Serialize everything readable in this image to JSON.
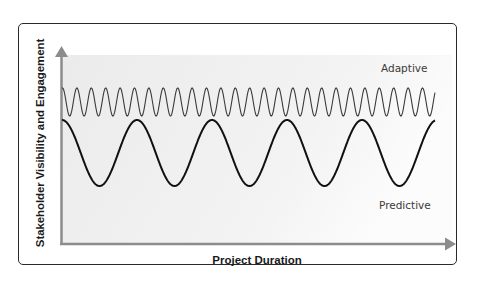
{
  "chart_data": {
    "type": "line",
    "title": "",
    "xlabel": "Project Duration",
    "ylabel": "Stakeholder Visibility and Engagement",
    "grid": false,
    "legend": "inline labels",
    "axes": {
      "x_ticks": [],
      "y_ticks": [],
      "arrows": true
    },
    "series": [
      {
        "name": "Adaptive",
        "description": "High-frequency oscillation at consistently high engagement",
        "color": "#3a3a3a",
        "approx_cycles": 26,
        "level": "high",
        "amplitude": "small"
      },
      {
        "name": "Predictive",
        "description": "Low-frequency oscillation with large swings between high and low engagement",
        "color": "#1a1a1a",
        "approx_cycles": 5,
        "level": "medium",
        "amplitude": "large"
      }
    ]
  },
  "labels": {
    "y_axis": "Stakeholder Visibility and Engagement",
    "x_axis": "Project Duration",
    "adaptive": "Adaptive",
    "predictive": "Predictive"
  },
  "colors": {
    "frame_border": "#2a2a2a",
    "axis": "#8a8a8a",
    "plot_bg_start": "#ececec",
    "plot_bg_end": "#fbfbfb",
    "adaptive_line": "#3a3a3a",
    "predictive_line": "#111111"
  }
}
